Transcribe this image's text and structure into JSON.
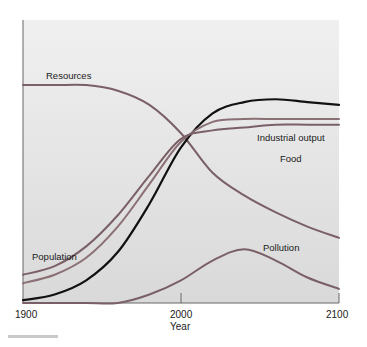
{
  "chart_data": {
    "type": "line",
    "title": "",
    "xlabel": "Year",
    "ylabel": "",
    "xlim": [
      1900,
      2100
    ],
    "ylim": [
      0,
      100
    ],
    "grid": false,
    "legend": "inline labels",
    "x_ticks": [
      "1900",
      "2000",
      "2100"
    ],
    "x": [
      1900,
      1920,
      1940,
      1960,
      1980,
      2000,
      2020,
      2040,
      2060,
      2080,
      2100
    ],
    "series": [
      {
        "name": "Resources",
        "color": "#7a6066",
        "values": [
          77,
          77,
          77,
          75,
          70,
          60,
          46,
          38,
          32,
          27,
          23
        ]
      },
      {
        "name": "Industrial output",
        "color": "#111111",
        "values": [
          1,
          3,
          8,
          18,
          35,
          55,
          67,
          71,
          72,
          71,
          70
        ]
      },
      {
        "name": "Food",
        "color": "#8a7075",
        "values": [
          7,
          10,
          16,
          27,
          42,
          57,
          64,
          65,
          65,
          65,
          65
        ]
      },
      {
        "name": "Population",
        "color": "#7a6066",
        "values": [
          10,
          13,
          20,
          31,
          45,
          58,
          61,
          62,
          63,
          63,
          63
        ]
      },
      {
        "name": "Pollution",
        "color": "#7a6066",
        "values": [
          0,
          0,
          0,
          0,
          3,
          8,
          15,
          19,
          15,
          9,
          5
        ]
      }
    ]
  },
  "labels": {
    "resources": "Resources",
    "industrial": "Industrial output",
    "food": "Food",
    "population": "Population",
    "pollution": "Pollution",
    "x_1900": "1900",
    "x_2000": "2000",
    "x_2100": "2100",
    "xlabel": "Year"
  }
}
